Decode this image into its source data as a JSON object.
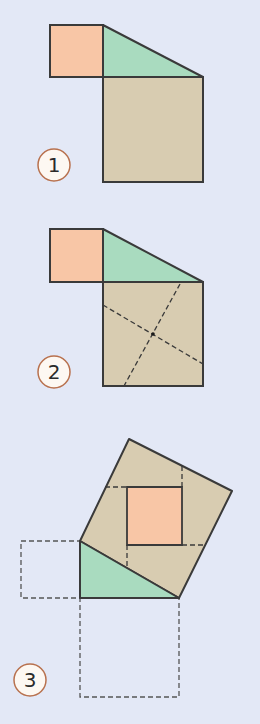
{
  "colors": {
    "background": "#e3e8f6",
    "small_square": "#f8c6a6",
    "triangle": "#a9dbbf",
    "large_square": "#d8ccb1",
    "outline": "#3a3a3a",
    "label_fill": "#fdf8f2",
    "label_stroke": "#b8714e"
  },
  "figures": [
    {
      "step": "1",
      "label": "1",
      "small_square": [
        [
          50,
          25
        ],
        [
          103,
          25
        ],
        [
          103,
          77
        ],
        [
          50,
          77
        ]
      ],
      "triangle": [
        [
          103,
          25
        ],
        [
          103,
          77
        ],
        [
          203,
          77
        ]
      ],
      "large_square": [
        [
          103,
          77
        ],
        [
          203,
          77
        ],
        [
          203,
          182
        ],
        [
          103,
          182
        ]
      ],
      "dashed_lines": [],
      "label_pos": [
        54,
        165
      ]
    },
    {
      "step": "2",
      "label": "2",
      "small_square": [
        [
          50,
          229
        ],
        [
          103,
          229
        ],
        [
          103,
          282
        ],
        [
          50,
          282
        ]
      ],
      "triangle": [
        [
          103,
          229
        ],
        [
          103,
          282
        ],
        [
          203,
          282
        ]
      ],
      "large_square": [
        [
          103,
          282
        ],
        [
          203,
          282
        ],
        [
          203,
          386
        ],
        [
          103,
          386
        ]
      ],
      "dashed_lines": [
        [
          [
            103,
            305
          ],
          [
            203,
            364
          ]
        ],
        [
          [
            180,
            285
          ],
          [
            124,
            386
          ]
        ]
      ],
      "center_dot": [
        153,
        334
      ],
      "label_pos": [
        54,
        372
      ]
    },
    {
      "step": "3",
      "label": "3",
      "tilted_square": [
        [
          80,
          541
        ],
        [
          129,
          439
        ],
        [
          232,
          491
        ],
        [
          179,
          598
        ]
      ],
      "triangle": [
        [
          80,
          541
        ],
        [
          80,
          598
        ],
        [
          179,
          598
        ]
      ],
      "inner_square": [
        [
          127,
          487
        ],
        [
          182,
          487
        ],
        [
          182,
          545
        ],
        [
          127,
          545
        ]
      ],
      "dashed_squares": [
        [
          [
            21,
            541
          ],
          [
            80,
            541
          ],
          [
            80,
            598
          ],
          [
            21,
            598
          ]
        ],
        [
          [
            80,
            598
          ],
          [
            179,
            598
          ],
          [
            179,
            697
          ],
          [
            80,
            697
          ]
        ]
      ],
      "dashed_lines": [
        [
          [
            105,
            487
          ],
          [
            127,
            487
          ]
        ],
        [
          [
            182,
            467
          ],
          [
            182,
            487
          ]
        ],
        [
          [
            182,
            545
          ],
          [
            205,
            545
          ]
        ],
        [
          [
            127,
            545
          ],
          [
            127,
            568
          ]
        ]
      ],
      "label_pos": [
        30,
        680
      ]
    }
  ]
}
